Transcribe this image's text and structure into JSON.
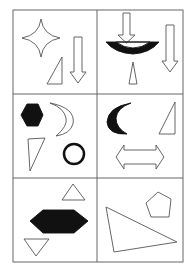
{
  "figure": {
    "title": "3x2 shape grid puzzle",
    "layout": {
      "rows": 3,
      "cols": 2
    },
    "colors": {
      "stroke": "#555555",
      "fill_dark": "#111111",
      "background": "#ffffff",
      "grid": "#666666"
    },
    "cells": [
      {
        "id": "r1c1",
        "shapes": [
          "four-point-star-outline",
          "right-triangle-outline",
          "down-arrow-outline"
        ]
      },
      {
        "id": "r1c2",
        "shapes": [
          "down-arrow-outline",
          "black-arc-bowl",
          "down-arrow-outline-tall",
          "narrow-triangle-outline"
        ]
      },
      {
        "id": "r2c1",
        "shapes": [
          "black-hexagon",
          "crescent-outline",
          "triangle-outline",
          "circle-ring-thick"
        ]
      },
      {
        "id": "r2c2",
        "shapes": [
          "black-crescent",
          "right-triangle-outline",
          "double-arrow-outline"
        ]
      },
      {
        "id": "r3c1",
        "shapes": [
          "triangle-up-outline",
          "black-elongated-hexagon",
          "triangle-down-outline"
        ]
      },
      {
        "id": "r3c2",
        "shapes": [
          "pentagon-outline",
          "large-triangle-outline"
        ]
      }
    ]
  }
}
